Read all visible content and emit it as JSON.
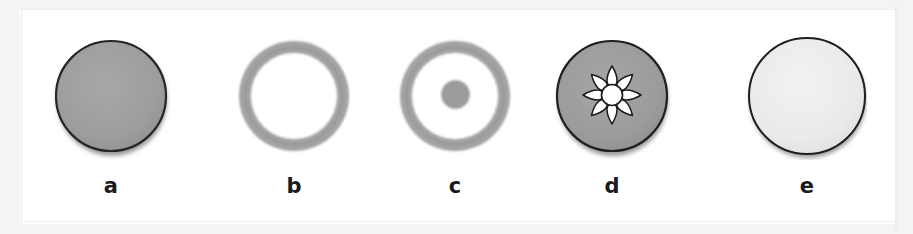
{
  "figure": {
    "kind": "photographic-plate",
    "background_color": "#ffffff",
    "panel_count": 5,
    "panels": [
      {
        "id": "a",
        "caption": "a",
        "shape": "solid-disc",
        "description": "solid medium-gray disc with thin dark outline",
        "fill_color": "#9d9d9d",
        "outline_color": "#262626",
        "outer_diameter_px": 112,
        "inner_diameter_px": 0,
        "center_dot_diameter_px": 0,
        "petal_count": 0
      },
      {
        "id": "b",
        "caption": "b",
        "shape": "annulus",
        "description": "gray ring with open white center",
        "fill_color": "#a3a3a3",
        "outline_color": "#7a7a7a",
        "outer_diameter_px": 112,
        "inner_diameter_px": 86,
        "center_dot_diameter_px": 0,
        "petal_count": 0
      },
      {
        "id": "c",
        "caption": "c",
        "shape": "annulus-with-center-dot",
        "description": "gray ring with open white center and small gray dot at the center",
        "fill_color": "#a3a3a3",
        "outline_color": "#7a7a7a",
        "outer_diameter_px": 112,
        "inner_diameter_px": 86,
        "center_dot_diameter_px": 28,
        "petal_count": 0
      },
      {
        "id": "d",
        "caption": "d",
        "shape": "disc-with-petal-rosette",
        "description": "solid gray disc with a white central hole surrounded by eight white teardrop petals",
        "fill_color": "#9d9d9d",
        "outline_color": "#1f1f1f",
        "outer_diameter_px": 112,
        "inner_diameter_px": 0,
        "center_dot_diameter_px": 20,
        "petal_count": 8
      },
      {
        "id": "e",
        "caption": "e",
        "shape": "solid-disc",
        "description": "very light gray, almost white disc with thin dark outline",
        "fill_color": "#ebebeb",
        "outline_color": "#1f1f1f",
        "outer_diameter_px": 118,
        "inner_diameter_px": 0,
        "center_dot_diameter_px": 0,
        "petal_count": 0
      }
    ],
    "colors": {
      "background": "#ffffff",
      "mid_gray": "#9d9d9d",
      "ring_gray": "#a3a3a3",
      "light_gray": "#ebebeb",
      "outline_dark": "#1f1f1f",
      "caption_text": "#1a1a1a",
      "scan_margin": "#f4f4f4"
    }
  }
}
